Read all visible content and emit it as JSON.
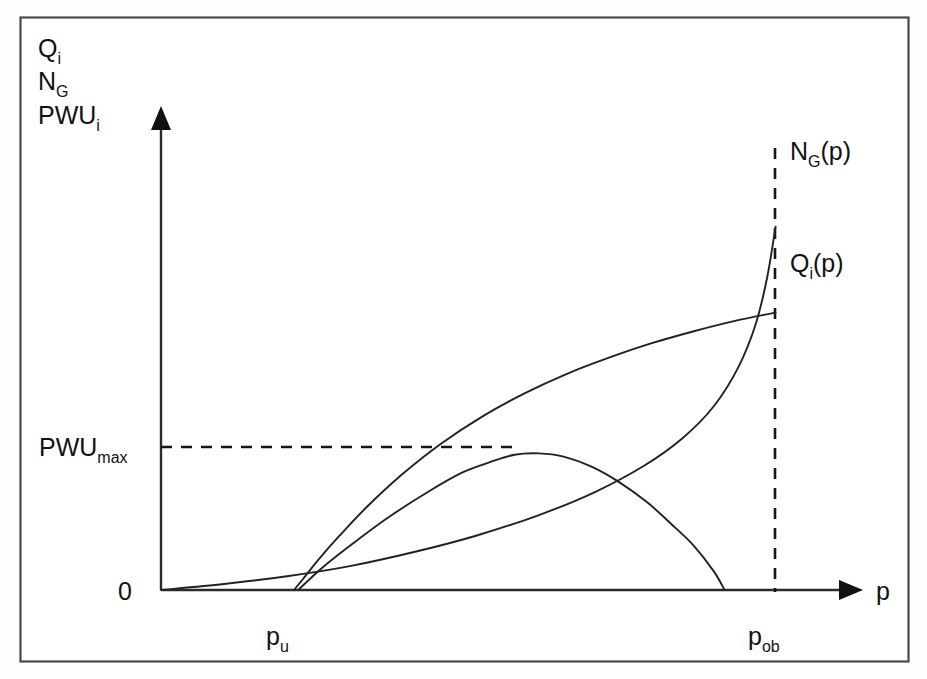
{
  "figure": {
    "title": "",
    "background_color": "#ffffff",
    "frame_color": "#4a4a4a",
    "line_color": "#222222"
  },
  "axes": {
    "y_axis_labels": [
      "Q",
      "N",
      "PWU"
    ],
    "y_label_line1": "Q",
    "y_label_line1_sub": "i",
    "y_label_line2": "N",
    "y_label_line2_sub": "G",
    "y_label_line3": "PWU",
    "y_label_line3_sub": "i",
    "x_axis_label": "p",
    "origin_label": "0",
    "x_tick_1_label": "p",
    "x_tick_1_sub": "u",
    "x_tick_2_label": "p",
    "x_tick_2_sub": "ob",
    "y_gridline_label": "PWU",
    "y_gridline_sub": "max"
  },
  "curve_labels": {
    "ng_label": "N",
    "ng_label_sub": "G",
    "ng_label_tail": "(p)",
    "qi_label": "Q",
    "qi_label_sub": "i",
    "qi_label_tail": "(p)"
  },
  "chart_data": {
    "type": "line",
    "title": "",
    "xlabel": "p",
    "ylabel": "Q_i, N_G, PWU_i",
    "xlim": [
      0,
      1
    ],
    "ylim": [
      0,
      1
    ],
    "grid": false,
    "legend": "inline-right",
    "annotations": [
      {
        "name": "p_u",
        "type": "x-marker",
        "x": 0.19,
        "text": "p_u"
      },
      {
        "name": "p_ob",
        "type": "x-dashed-vertical",
        "x": 0.878,
        "text": "p_ob"
      },
      {
        "name": "PWU_max",
        "type": "y-dashed-horizontal",
        "y": 0.297,
        "text": "PWU_max"
      },
      {
        "name": "origin",
        "type": "point",
        "x": 0,
        "y": 0,
        "text": "0"
      }
    ],
    "series": [
      {
        "name": "Q_i(p)",
        "label": "Q_i(p)",
        "description": "Rises steeply from p_u then saturates, reaching its maximum at p_ob",
        "x": [
          0.19,
          0.205,
          0.225,
          0.255,
          0.295,
          0.345,
          0.4,
          0.46,
          0.52,
          0.58,
          0.64,
          0.7,
          0.76,
          0.82,
          0.878
        ],
        "y": [
          0.0,
          0.028,
          0.066,
          0.118,
          0.182,
          0.252,
          0.318,
          0.378,
          0.428,
          0.47,
          0.505,
          0.536,
          0.562,
          0.585,
          0.603
        ]
      },
      {
        "name": "N_G(p)",
        "label": "N_G(p)",
        "description": "Slow near-linear growth from origin then sharp exponential rise near p_ob",
        "x": [
          0.0,
          0.09,
          0.18,
          0.27,
          0.36,
          0.45,
          0.54,
          0.62,
          0.69,
          0.745,
          0.79,
          0.825,
          0.85,
          0.866,
          0.878
        ],
        "y": [
          0.0,
          0.013,
          0.03,
          0.052,
          0.082,
          0.118,
          0.163,
          0.213,
          0.27,
          0.33,
          0.4,
          0.485,
          0.58,
          0.68,
          0.79
        ]
      },
      {
        "name": "PWU_i(p)",
        "label": "PWU_i(p)",
        "description": "Rises from p_u to the maximum PWU_max then falls back to zero before p_ob",
        "x": [
          0.196,
          0.23,
          0.275,
          0.325,
          0.38,
          0.43,
          0.47,
          0.505,
          0.54,
          0.575,
          0.615,
          0.655,
          0.695,
          0.73,
          0.76,
          0.79,
          0.805
        ],
        "y": [
          0.0,
          0.048,
          0.102,
          0.158,
          0.212,
          0.255,
          0.278,
          0.294,
          0.297,
          0.29,
          0.268,
          0.234,
          0.19,
          0.142,
          0.098,
          0.04,
          0.0
        ]
      }
    ]
  }
}
